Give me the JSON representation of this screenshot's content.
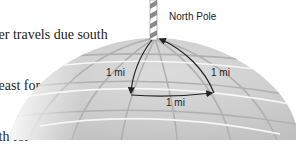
{
  "problem_text": {
    "lines": [
      "...er travels due south",
      "...east for one",
      "...th for",
      "...ack"
    ]
  },
  "diagram": {
    "pole_label": "North Pole",
    "edges": [
      {
        "id": "south-leg",
        "label": "1 mi",
        "direction": "south"
      },
      {
        "id": "east-leg",
        "label": "1 mi",
        "direction": "east"
      },
      {
        "id": "north-leg",
        "label": "1 mi",
        "direction": "north"
      }
    ],
    "colors": {
      "globe": "#cfcfcf",
      "grid": "#b3b3b3",
      "highlight": "#f4f4f4",
      "path": "#222222",
      "pole_stripe": "#8a8a8a"
    }
  }
}
